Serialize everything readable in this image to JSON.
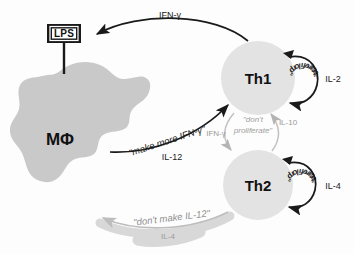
{
  "figure": {
    "background_color": "#fdfdfd"
  },
  "colors": {
    "macrophage_fill": "#c9c9c9",
    "th_cell_fill": "#e3e3e3",
    "arrow_black": "#1a1a1a",
    "arrow_gray": "#b4b4b4",
    "band_gray": "#d8d8d8",
    "text_black": "#1a1a1a",
    "text_gray": "#9a9a9a"
  },
  "nodes": {
    "macrophage": {
      "label": "MΦ",
      "name": "macrophage"
    },
    "th1": {
      "label": "Th1",
      "name": "th1-cell"
    },
    "th2": {
      "label": "Th2",
      "name": "th2-cell"
    },
    "lps": {
      "label": "LPS",
      "name": "lps-stimulus"
    }
  },
  "edges": {
    "th1_to_macrophage": {
      "cytokine": "IFN-γ",
      "source": "Th1",
      "target": "MΦ"
    },
    "macrophage_to_th1": {
      "message": "\"make more IFN-γ\"",
      "cytokine": "IL-12",
      "source": "MΦ",
      "target": "Th1"
    },
    "th1_to_th2": {
      "cytokine": "IFN-γ",
      "message": "\"don't proliferate\"",
      "message_line1": "\"don't",
      "message_line2": "proliferate\"",
      "source": "Th1",
      "target": "Th2"
    },
    "th2_to_th1": {
      "cytokine": "IL-10",
      "source": "Th2",
      "target": "Th1"
    },
    "th2_to_macrophage": {
      "message": "\"don't make IL-12\"",
      "cytokine": "IL-4",
      "source": "Th2",
      "target": "MΦ"
    },
    "th1_autocrine": {
      "message": "\"proliferate\"",
      "cytokine": "IL-2",
      "source": "Th1",
      "target": "Th1"
    },
    "th2_autocrine": {
      "message": "\"proliferate\"",
      "cytokine": "IL-4",
      "source": "Th2",
      "target": "Th2"
    }
  },
  "prolif_glyphs": {
    "th1": [
      {
        "ch": "“",
        "angle": -62
      },
      {
        "ch": "p",
        "angle": -48
      },
      {
        "ch": "r",
        "angle": -35
      },
      {
        "ch": "o",
        "angle": -24
      },
      {
        "ch": "l",
        "angle": -13
      },
      {
        "ch": "i",
        "angle": -4
      },
      {
        "ch": "f",
        "angle": 6
      },
      {
        "ch": "e",
        "angle": 17
      },
      {
        "ch": "r",
        "angle": 28
      },
      {
        "ch": "a",
        "angle": 39
      },
      {
        "ch": "t",
        "angle": 50
      },
      {
        "ch": "e",
        "angle": 60
      },
      {
        "ch": "”",
        "angle": 70
      }
    ],
    "th2": [
      {
        "ch": "“",
        "angle": -62
      },
      {
        "ch": "p",
        "angle": -48
      },
      {
        "ch": "r",
        "angle": -35
      },
      {
        "ch": "o",
        "angle": -24
      },
      {
        "ch": "l",
        "angle": -13
      },
      {
        "ch": "i",
        "angle": -4
      },
      {
        "ch": "f",
        "angle": 6
      },
      {
        "ch": "e",
        "angle": 17
      },
      {
        "ch": "r",
        "angle": 28
      },
      {
        "ch": "a",
        "angle": 39
      },
      {
        "ch": "t",
        "angle": 50
      },
      {
        "ch": "e",
        "angle": 60
      },
      {
        "ch": "”",
        "angle": 70
      }
    ]
  }
}
